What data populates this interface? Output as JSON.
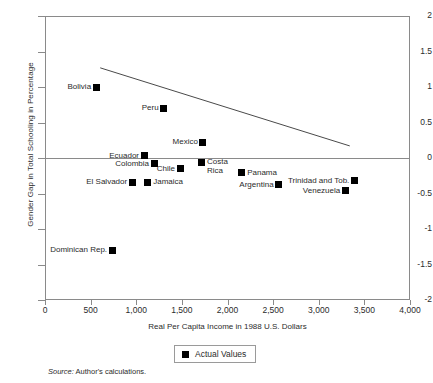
{
  "chart_data": {
    "type": "scatter",
    "title": "",
    "xlabel": "Real Per Capita Income in 1988 U.S. Dollars",
    "ylabel": "Gender Gap in Total Schooling in Percentage",
    "xlim": [
      0,
      4000
    ],
    "ylim": [
      -2,
      2
    ],
    "xticks": [
      "0",
      "500",
      "1,000",
      "1,500",
      "2,000",
      "2,500",
      "3,000",
      "3,500",
      "4,000"
    ],
    "xtick_values": [
      0,
      500,
      1000,
      1500,
      2000,
      2500,
      3000,
      3500,
      4000
    ],
    "yticks": [
      "2",
      "1.5",
      "1",
      "0.5",
      "0",
      "-0.5",
      "-1",
      "-1.5",
      "-2"
    ],
    "ytick_values": [
      2,
      1.5,
      1,
      0.5,
      0,
      -0.5,
      -1,
      -1.5,
      -2
    ],
    "grid": false,
    "zero_line": true,
    "legend": {
      "position": "bottom-center",
      "entries": [
        "Actual Values"
      ]
    },
    "points": [
      {
        "label": "Bolivia",
        "x": 560,
        "y": 1.0,
        "label_side": "left"
      },
      {
        "label": "Peru",
        "x": 1300,
        "y": 0.7,
        "label_side": "left"
      },
      {
        "label": "Mexico",
        "x": 1730,
        "y": 0.22,
        "label_side": "left"
      },
      {
        "label": "Ecuador",
        "x": 1085,
        "y": 0.03,
        "label_side": "left"
      },
      {
        "label": "Colombia",
        "x": 1195,
        "y": -0.08,
        "label_side": "left"
      },
      {
        "label": "Chile",
        "x": 1480,
        "y": -0.15,
        "label_side": "left"
      },
      {
        "label": "Costa\nRica",
        "x": 1710,
        "y": -0.07,
        "label_side": "right"
      },
      {
        "label": "Panama",
        "x": 2150,
        "y": -0.21,
        "label_side": "right"
      },
      {
        "label": "El Salvador",
        "x": 955,
        "y": -0.34,
        "label_side": "left"
      },
      {
        "label": "Jamaica",
        "x": 1120,
        "y": -0.34,
        "label_side": "right"
      },
      {
        "label": "Argentina",
        "x": 2560,
        "y": -0.38,
        "label_side": "left"
      },
      {
        "label": "Trinidad and Tob.",
        "x": 3390,
        "y": -0.32,
        "label_side": "left"
      },
      {
        "label": "Venezuela",
        "x": 3290,
        "y": -0.46,
        "label_side": "left"
      },
      {
        "label": "Dominican Rep.",
        "x": 735,
        "y": -1.3,
        "label_side": "left"
      }
    ],
    "trend_line": {
      "x1": 605,
      "y1": 1.27,
      "x2": 3340,
      "y2": 0.17,
      "color": "#4a4a4a"
    }
  },
  "source_note": {
    "prefix": "Source:",
    "text": "Author's calculations."
  },
  "colors": {
    "marker": "#000000",
    "axis": "#8a8a8a",
    "text": "#2b2b2b"
  }
}
